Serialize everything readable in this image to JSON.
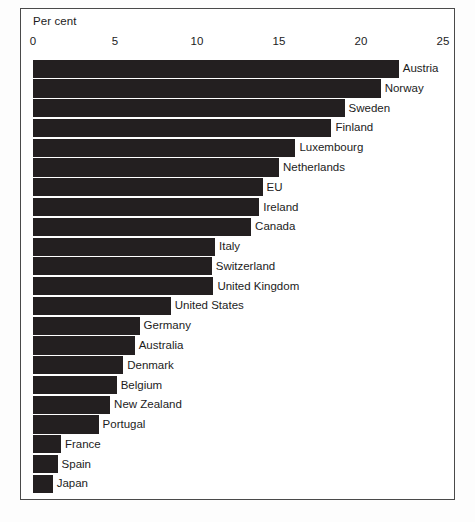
{
  "chart_data": {
    "type": "bar",
    "orientation": "horizontal",
    "title": "",
    "xlabel": "Per cent",
    "ylabel": "",
    "xlim": [
      0,
      25
    ],
    "xticks": [
      0,
      5,
      10,
      15,
      20,
      25
    ],
    "xtick_labels": [
      "0",
      "5",
      "10",
      "15",
      "20",
      "25"
    ],
    "grid": false,
    "legend": false,
    "bar_color": "#231f20",
    "categories": [
      "Austria",
      "Norway",
      "Sweden",
      "Finland",
      "Luxembourg",
      "Netherlands",
      "EU",
      "Ireland",
      "Canada",
      "Italy",
      "Switzerland",
      "United Kingdom",
      "United States",
      "Germany",
      "Australia",
      "Denmark",
      "Belgium",
      "New Zealand",
      "Portugal",
      "France",
      "Spain",
      "Japan"
    ],
    "values": [
      22.3,
      21.2,
      19.0,
      18.2,
      16.0,
      15.0,
      14.0,
      13.8,
      13.3,
      11.1,
      10.9,
      11.0,
      8.4,
      6.5,
      6.2,
      5.5,
      5.1,
      4.7,
      4.0,
      1.7,
      1.5,
      1.2
    ]
  },
  "axis": {
    "unit_label": "Per cent"
  }
}
